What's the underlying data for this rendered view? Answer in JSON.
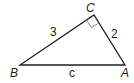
{
  "diagram": {
    "type": "right-triangle",
    "vertices": {
      "A": {
        "label": "A",
        "x": 125,
        "y": 65
      },
      "B": {
        "label": "B",
        "x": 20,
        "y": 65
      },
      "C": {
        "label": "C",
        "x": 94,
        "y": 15
      }
    },
    "sides": {
      "BC": {
        "label": "3"
      },
      "CA": {
        "label": "2"
      },
      "AB": {
        "label": "c"
      }
    },
    "right_angle_at": "C",
    "stroke_color": "#231f20",
    "marker_color": "#8a8a8a"
  }
}
